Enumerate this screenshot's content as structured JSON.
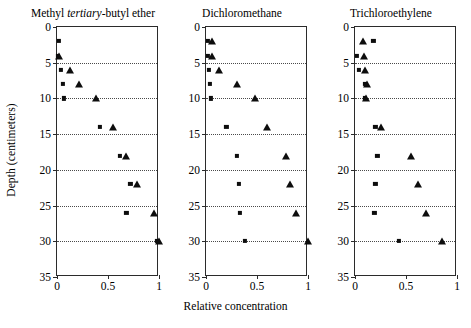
{
  "figure": {
    "ylabel": "Depth (centimeters)",
    "xlabel": "Relative concentration"
  },
  "axes": {
    "y_ticks": [
      0,
      5,
      10,
      15,
      20,
      25,
      30,
      35
    ],
    "y_tick_labels": [
      "0",
      "5",
      "10",
      "15",
      "20",
      "25",
      "30",
      "35"
    ],
    "x_ticks": [
      0,
      0.5,
      1
    ],
    "x_tick_labels": [
      "0",
      "0.5",
      "1"
    ],
    "ylim": [
      0,
      35
    ],
    "xlim": [
      0,
      1
    ],
    "y_inverted": true,
    "grid": "horizontal-dotted"
  },
  "chart_data": {
    "type": "scatter",
    "title": "",
    "xlabel": "Relative concentration",
    "ylabel": "Depth (centimeters)",
    "xlim": [
      0,
      1
    ],
    "ylim": [
      35,
      0
    ],
    "grid": true,
    "legend": "none",
    "panels": [
      {
        "title_plain": "Methyl tertiary-butyl ether",
        "title_parts": [
          {
            "text": "Methyl ",
            "italic": false
          },
          {
            "text": "tertiary",
            "italic": true
          },
          {
            "text": "-butyl ether",
            "italic": false
          }
        ],
        "series": [
          {
            "name": "square",
            "marker": "square",
            "depth_cm": [
              2,
              4,
              6,
              8,
              10,
              14,
              18,
              22,
              26,
              30
            ],
            "relative_concentration": [
              0.02,
              0.01,
              0.04,
              0.06,
              0.07,
              0.42,
              0.62,
              0.72,
              0.68,
              0.98
            ]
          },
          {
            "name": "triangle",
            "marker": "triangle",
            "depth_cm": [
              4,
              6,
              8,
              10,
              14,
              18,
              22,
              26,
              30
            ],
            "relative_concentration": [
              0.02,
              0.13,
              0.22,
              0.38,
              0.55,
              0.68,
              0.78,
              0.95,
              1.0
            ]
          }
        ]
      },
      {
        "title_plain": "Dichloromethane",
        "title_parts": [
          {
            "text": "Dichloromethane",
            "italic": false
          }
        ],
        "series": [
          {
            "name": "square",
            "marker": "square",
            "depth_cm": [
              2,
              4,
              6,
              8,
              10,
              14,
              18,
              22,
              26,
              30
            ],
            "relative_concentration": [
              0.02,
              0.02,
              0.03,
              0.04,
              0.05,
              0.2,
              0.3,
              0.32,
              0.33,
              0.38
            ]
          },
          {
            "name": "triangle",
            "marker": "triangle",
            "depth_cm": [
              2,
              4,
              6,
              8,
              10,
              14,
              18,
              22,
              26,
              30
            ],
            "relative_concentration": [
              0.06,
              0.06,
              0.13,
              0.3,
              0.48,
              0.6,
              0.78,
              0.82,
              0.88,
              1.0
            ]
          }
        ]
      },
      {
        "title_plain": "Trichloroethylene",
        "title_parts": [
          {
            "text": "Trichloroethylene",
            "italic": false
          }
        ],
        "series": [
          {
            "name": "square",
            "marker": "square",
            "depth_cm": [
              2,
              4,
              6,
              8,
              10,
              14,
              18,
              22,
              26,
              30
            ],
            "relative_concentration": [
              0.18,
              0.02,
              0.04,
              0.1,
              0.1,
              0.2,
              0.22,
              0.2,
              0.19,
              0.43
            ]
          },
          {
            "name": "triangle",
            "marker": "triangle",
            "depth_cm": [
              2,
              4,
              6,
              8,
              10,
              14,
              18,
              22,
              26,
              30
            ],
            "relative_concentration": [
              0.08,
              0.09,
              0.1,
              0.12,
              0.11,
              0.25,
              0.55,
              0.62,
              0.7,
              0.85
            ]
          }
        ]
      }
    ]
  }
}
